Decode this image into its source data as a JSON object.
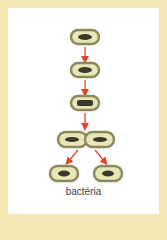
{
  "diagram": {
    "label": "bactéria",
    "stages": [
      "bacterium",
      "bacterium",
      "bacterium elongated",
      "dividing bacterium",
      "two daughter cells"
    ],
    "colors": {
      "border": "#f6e8b4",
      "cell_wall": "#8c8a5c",
      "cytoplasm": "#e9e6b8",
      "nucleoid": "#3a3a2a",
      "arrow": "#e0452a"
    }
  }
}
